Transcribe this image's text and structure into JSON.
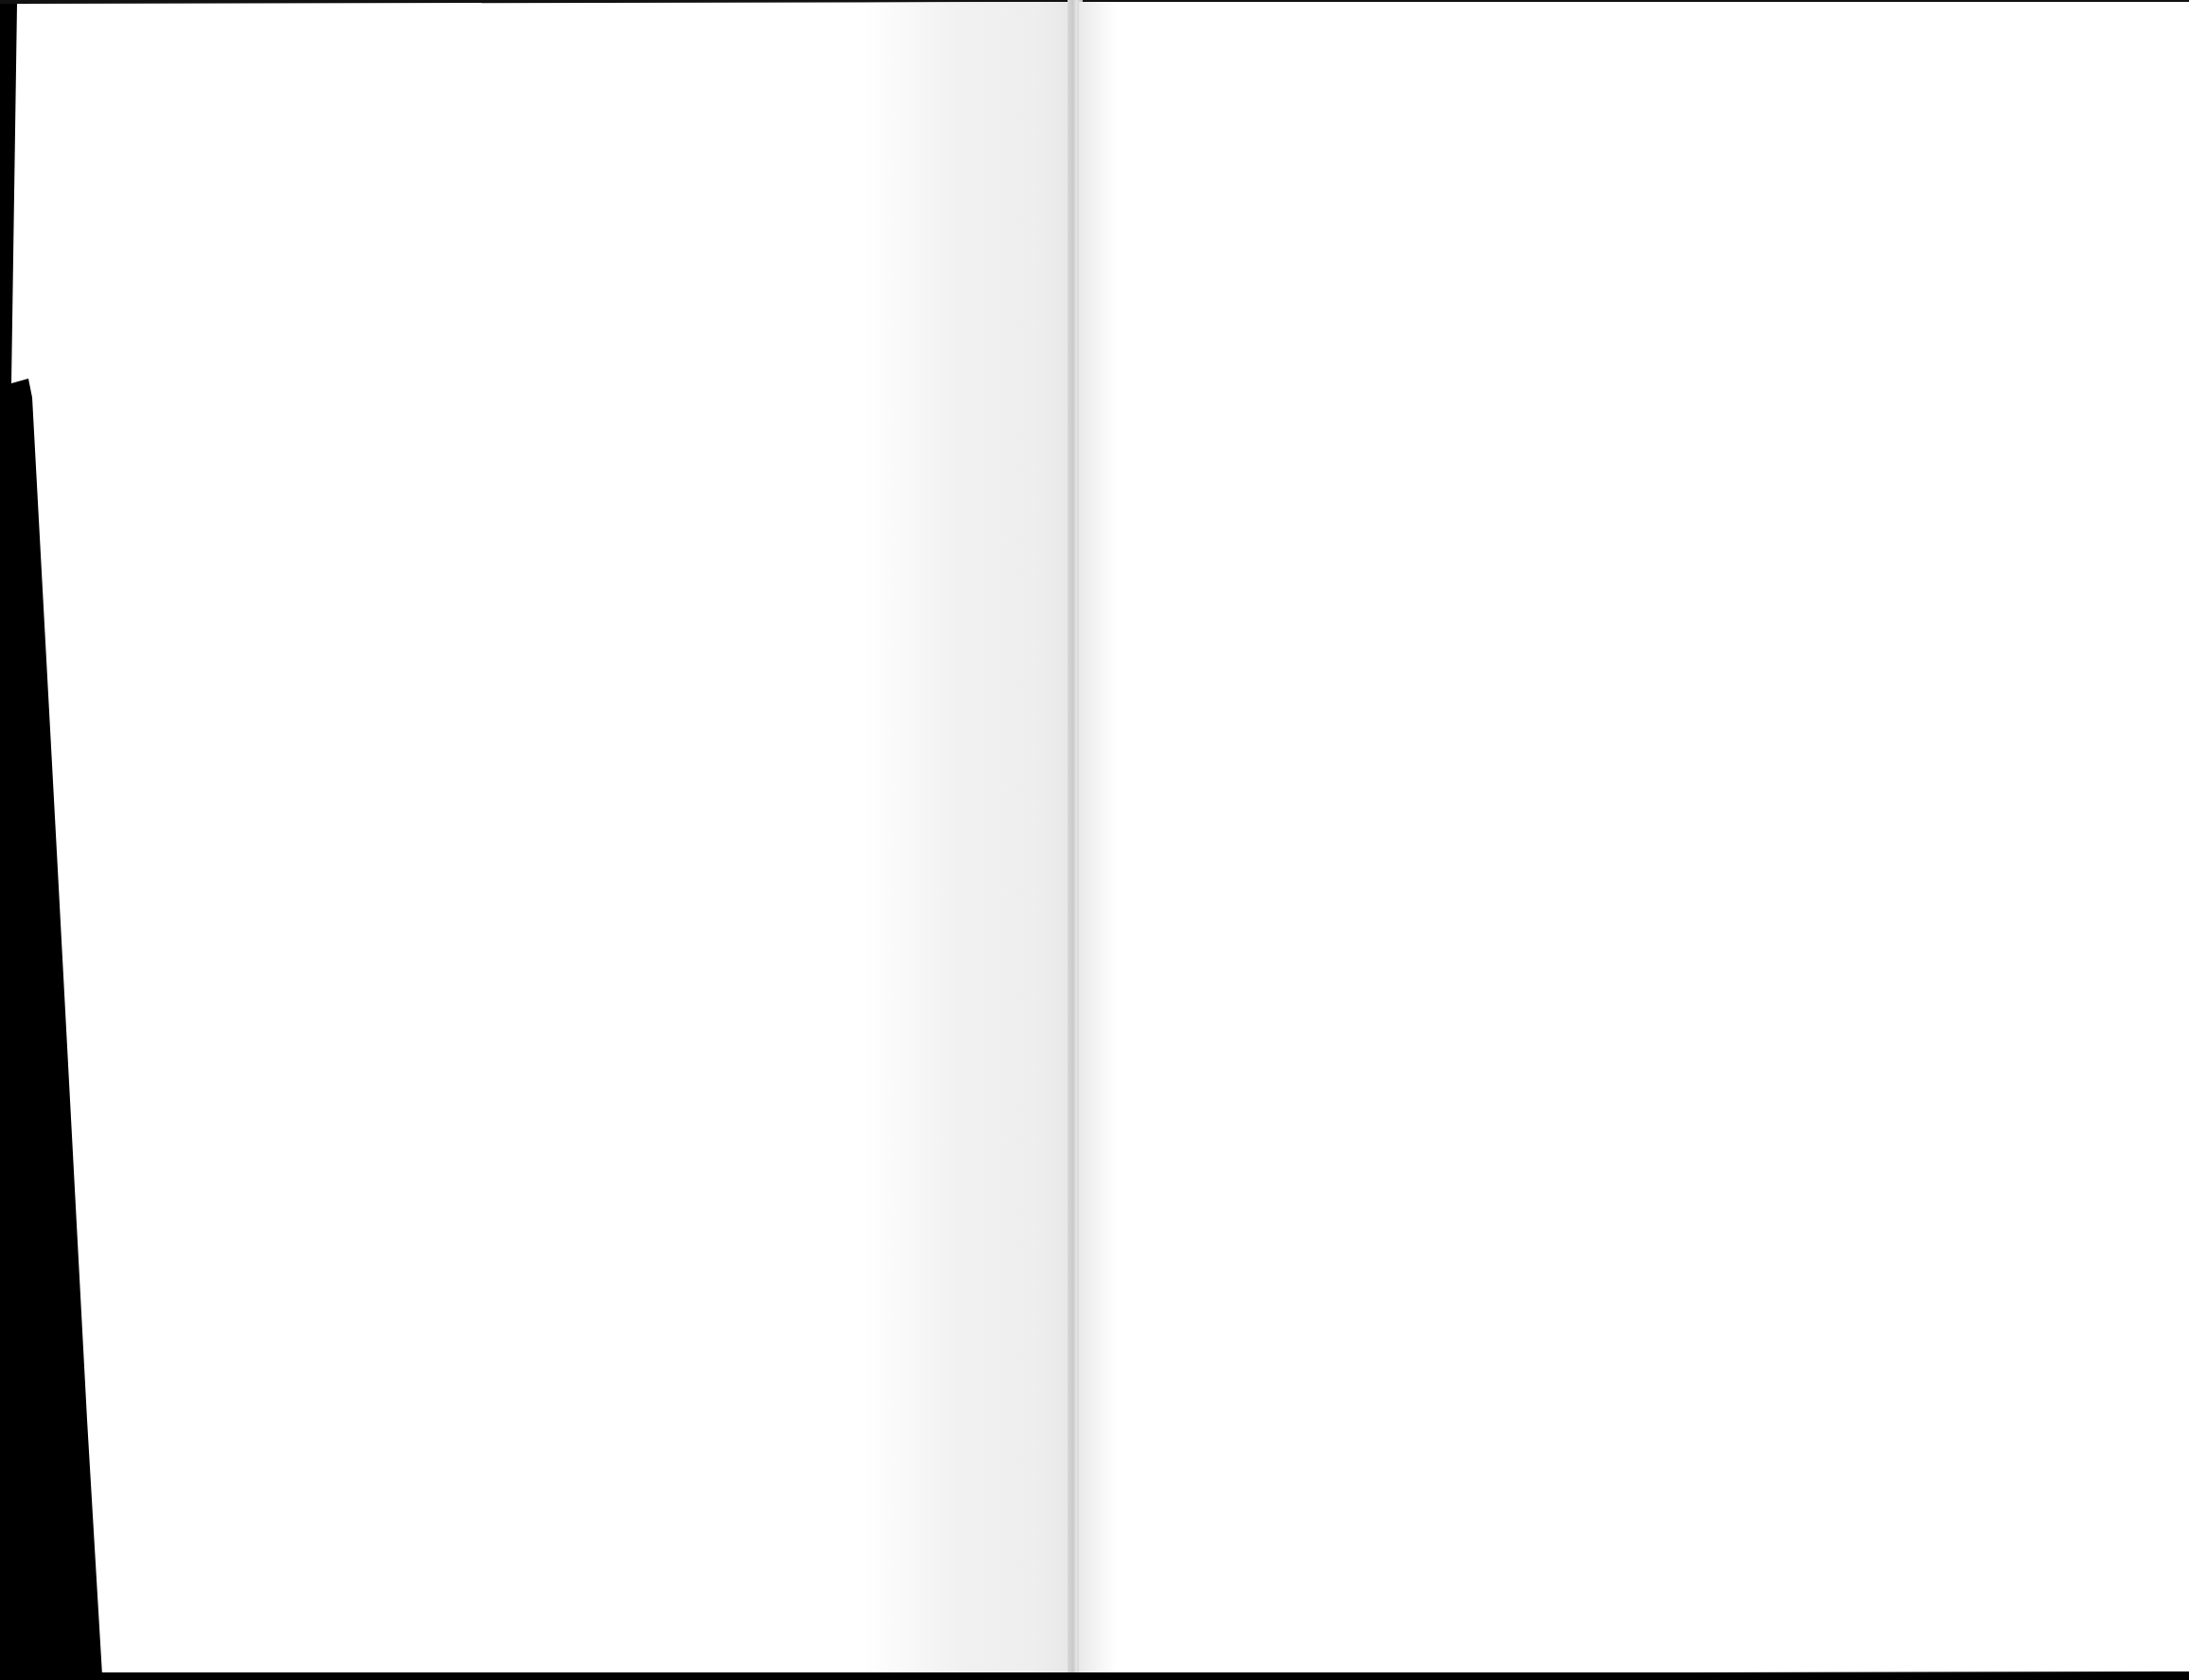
{
  "document": {
    "type": "scanned-book-spread",
    "pages": [
      {
        "side": "left",
        "content": ""
      },
      {
        "side": "right",
        "content": ""
      }
    ],
    "colors": {
      "background": "#000000",
      "paper": "#ffffff",
      "gutter_shadow": "#eeeeee",
      "spine": "#c9c9c9"
    }
  }
}
